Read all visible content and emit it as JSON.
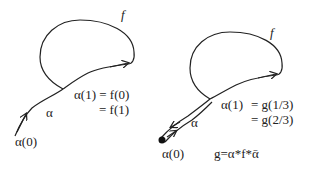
{
  "figure": {
    "left": {
      "loop_label": "f",
      "path_label": "α",
      "start_label": "α(0)",
      "junction_line1": "α(1) = f(0)",
      "junction_line2": "= f(1)"
    },
    "right": {
      "loop_label": "f",
      "path_label": "α",
      "start_label": "α(0)",
      "junction_line1": "α(1)",
      "junction_eq1": "= g(1/3)",
      "junction_eq2": "= g(2/3)",
      "composition": "g=α*f*ᾱ"
    }
  }
}
